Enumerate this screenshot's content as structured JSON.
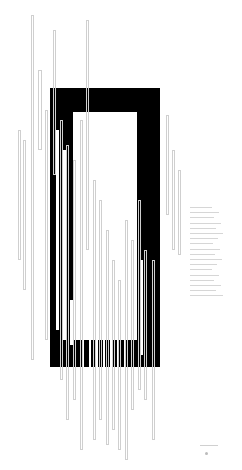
{
  "artwork": {
    "description": "Abstract composition: black rectangular frame overlaid with thin vertical outlined bars",
    "colors": {
      "frame": "#000000",
      "background": "#ffffff",
      "lines": "#cfcfcf"
    },
    "frame": {
      "outer": [
        50,
        88,
        160,
        367
      ],
      "inner": [
        73,
        112,
        137,
        340
      ]
    },
    "thin_bars": [
      [
        31,
        15,
        34,
        360
      ],
      [
        38,
        70,
        42,
        150
      ],
      [
        45,
        110,
        48,
        340
      ],
      [
        53,
        30,
        56,
        175
      ],
      [
        60,
        120,
        63,
        380
      ],
      [
        66,
        145,
        69,
        420
      ],
      [
        73,
        160,
        76,
        400
      ],
      [
        80,
        120,
        83,
        450
      ],
      [
        86,
        20,
        89,
        250
      ],
      [
        93,
        180,
        96,
        440
      ],
      [
        99,
        200,
        102,
        420
      ],
      [
        106,
        230,
        109,
        445
      ],
      [
        112,
        260,
        115,
        430
      ],
      [
        118,
        280,
        121,
        450
      ],
      [
        125,
        220,
        128,
        460
      ],
      [
        131,
        240,
        134,
        410
      ],
      [
        138,
        200,
        141,
        390
      ],
      [
        144,
        250,
        147,
        400
      ],
      [
        152,
        260,
        155,
        440
      ],
      [
        18,
        130,
        21,
        260
      ],
      [
        23,
        140,
        26,
        290
      ],
      [
        166,
        115,
        169,
        215
      ],
      [
        172,
        150,
        175,
        250
      ],
      [
        178,
        170,
        181,
        255
      ]
    ],
    "white_bars": [
      [
        56,
        130,
        59,
        330
      ],
      [
        63,
        150,
        66,
        340
      ],
      [
        70,
        300,
        73,
        345
      ],
      [
        140,
        260,
        143,
        355
      ],
      [
        82,
        340,
        84,
        367
      ],
      [
        89,
        340,
        91,
        367
      ],
      [
        96,
        340,
        98,
        367
      ],
      [
        103,
        340,
        105,
        367
      ],
      [
        110,
        340,
        112,
        367
      ],
      [
        117,
        340,
        119,
        367
      ],
      [
        124,
        340,
        126,
        367
      ]
    ]
  },
  "text_block": {
    "legible": false,
    "line_count": 18
  },
  "signature": {
    "legible": false
  }
}
